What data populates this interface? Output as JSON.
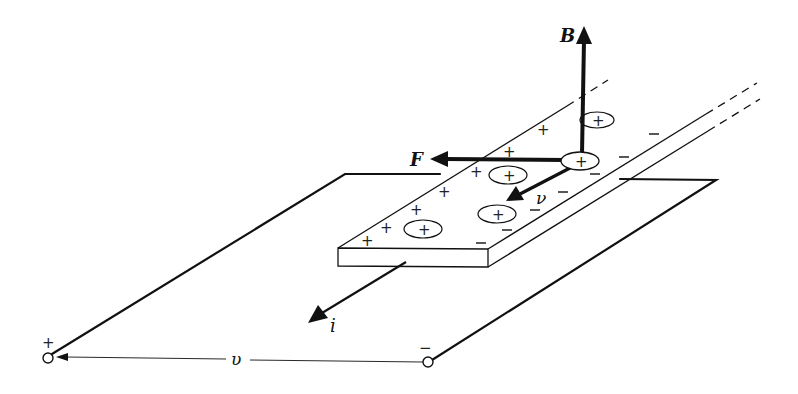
{
  "diagram": {
    "colors": {
      "ink": "#111111",
      "background": "#ffffff"
    },
    "vectors": {
      "magnetic_field": {
        "label": "B"
      },
      "force": {
        "label": "F"
      },
      "velocity": {
        "label": "ν"
      },
      "current": {
        "label": "i"
      }
    },
    "voltage": {
      "label": "υ",
      "positive_terminal": "+",
      "negative_terminal": "−"
    },
    "charges": {
      "positive_symbol": "+",
      "negative_symbol": "−",
      "carrier_symbol": "+"
    }
  }
}
